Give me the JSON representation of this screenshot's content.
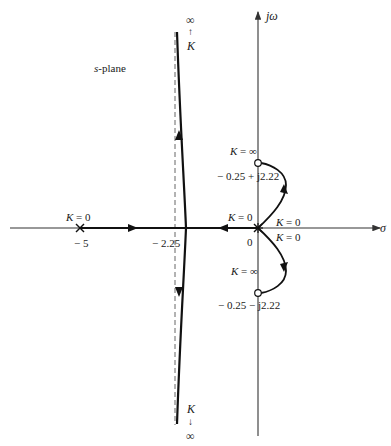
{
  "diagram": {
    "type": "root-locus",
    "plane_label_var": "s",
    "plane_label_rest": "-plane",
    "axes": {
      "real_label": "σ",
      "imag_label": "jω"
    },
    "poles": [
      {
        "location": "-5",
        "marker": "×",
        "label_k": "K = 0",
        "value_label": "− 5"
      },
      {
        "location": "0 (double)",
        "marker": "⊗",
        "labels_k": [
          "K = 0",
          "K = 0",
          "K = 0"
        ],
        "value_label": "0"
      }
    ],
    "zeros": [
      {
        "location": "-0.25 + j2.22",
        "marker": "○",
        "label_k": "K = ∞",
        "value_label": "− 0.25 + j2.22"
      },
      {
        "location": "-0.25 - j2.22",
        "marker": "○",
        "label_k": "K = ∞",
        "value_label": "− 0.25 − j2.22"
      }
    ],
    "asymptote": {
      "location": "-2.25",
      "value_label": "− 2.25",
      "style": "dashed"
    },
    "top_branch": {
      "infinity": "∞",
      "arrow": "↑",
      "k": "K"
    },
    "bottom_branch": {
      "infinity": "∞",
      "arrow": "↓",
      "k": "K"
    }
  }
}
